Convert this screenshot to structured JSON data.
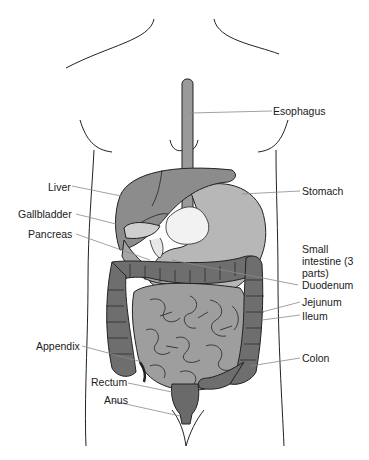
{
  "diagram": {
    "colors": {
      "outline": "#222222",
      "esophagus": "#9a9a9a",
      "liver": "#8c8c8c",
      "stomach": "#b7b7b7",
      "gallbladder": "#cfcfcf",
      "pancreas": "#a5a5a5",
      "small_intestine": "#9e9e9e",
      "colon": "#6e6e6e",
      "rectum": "#6a6a6a",
      "leader_line": "#8a8a8a"
    },
    "labels": {
      "esophagus": "Esophagus",
      "liver": "Liver",
      "stomach": "Stomach",
      "gallbladder": "Gallbladder",
      "pancreas": "Pancreas",
      "small_intestine": "Small intestine (3 parts)",
      "duodenum": "Duodenum",
      "jejunum": "Jejunum",
      "ileum": "Ileum",
      "appendix": "Appendix",
      "colon": "Colon",
      "rectum": "Rectum",
      "anus": "Anus"
    }
  }
}
